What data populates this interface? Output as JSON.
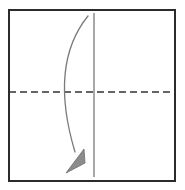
{
  "diagram": {
    "type": "origami-fold-instruction",
    "canvas": {
      "width": 185,
      "height": 190,
      "background": "#ffffff"
    },
    "paper_sheet": {
      "name": "square paper sheet",
      "x": 9,
      "y": 10,
      "width": 166,
      "height": 171,
      "stroke": "#2b2b2b",
      "stroke_width": 2,
      "fill": "#ffffff"
    },
    "crease_lines": [
      {
        "name": "horizontal-crease-dashed",
        "style": "dashed",
        "orientation": "horizontal",
        "x1": 9,
        "y1": 92,
        "x2": 175,
        "y2": 92,
        "stroke": "#333333",
        "stroke_width": 1.6,
        "dash_pattern": "7 4"
      },
      {
        "name": "vertical-crease-solid",
        "style": "solid",
        "orientation": "vertical",
        "x1": 94,
        "y1": 13,
        "x2": 94,
        "y2": 177,
        "stroke": "#6f6f6f",
        "stroke_width": 1.2,
        "dash_pattern": "none"
      }
    ],
    "fold_arrow": {
      "name": "fold-direction-arrow",
      "direction": "right-to-left-downward",
      "stroke": "#7a7a7a",
      "stroke_width": 1.3,
      "head_fill": "#8c8c8c",
      "head_stroke": "#6b6b6b",
      "path": "M 88 16 C 62 48, 57 92, 75 152",
      "head_points": "66,173 82,150 84,160",
      "start_point": [
        88,
        16
      ],
      "end_point": [
        70,
        166
      ]
    }
  },
  "colors": {
    "border": "#2b2b2b",
    "dashed_crease": "#333333",
    "solid_crease": "#6f6f6f",
    "arrow": "#7a7a7a",
    "arrow_head": "#8c8c8c",
    "background": "#ffffff"
  }
}
